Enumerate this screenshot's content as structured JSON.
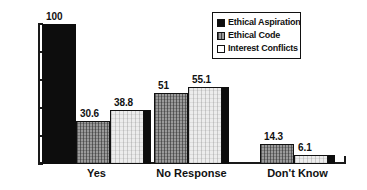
{
  "chart_data": {
    "type": "bar",
    "title": "",
    "xlabel": "",
    "ylabel": "",
    "ylim": [
      0,
      100
    ],
    "yticks": [
      0,
      20,
      40,
      60,
      80,
      100
    ],
    "grid": false,
    "legend_position": "top-right",
    "categories": [
      "Yes",
      "No Response",
      "Don't Know"
    ],
    "series": [
      {
        "name": "Ethical Aspiration",
        "swatch": "s0",
        "color": "#0d0d0d",
        "values": [
          100,
          0,
          0
        ],
        "labels": [
          "100",
          "",
          ""
        ]
      },
      {
        "name": "Ethical Code",
        "swatch": "s1",
        "color": "#9a9a9a",
        "values": [
          30.6,
          51,
          14.3
        ],
        "labels": [
          "30.6",
          "51",
          "14.3"
        ]
      },
      {
        "name": "Interest Conflicts",
        "swatch": "s2",
        "color": "#ececec",
        "values": [
          38.8,
          55.1,
          6.1
        ],
        "labels": [
          "38.8",
          "55.1",
          "6.1"
        ]
      }
    ]
  },
  "axis": {
    "y_tick_labels": [
      "100",
      "80",
      "60",
      "40",
      "20",
      "0"
    ]
  },
  "legend": {
    "items": [
      {
        "label": "Ethical Aspiration"
      },
      {
        "label": "Ethical Code"
      },
      {
        "label": "Interest Conflicts"
      }
    ]
  }
}
